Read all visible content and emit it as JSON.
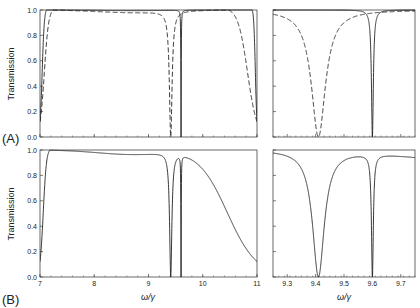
{
  "chart_data": [
    {
      "panel": "A-left",
      "type": "line",
      "xlim": [
        7,
        11
      ],
      "ylim": [
        0,
        1
      ],
      "ylabel": "Transmission",
      "xlabel": "",
      "xticks": [
        7,
        8,
        9,
        10,
        11
      ],
      "xtick_labels_visible": false,
      "yticks": [
        0.0,
        0.2,
        0.4,
        0.6,
        0.8,
        1.0
      ],
      "series": [
        {
          "name": "solid",
          "style": "solid",
          "band_low": 7.0,
          "band_high": 11.0,
          "edge_width_low": 0.08,
          "edge_width_high": 0.06,
          "ripple": 0.005,
          "dips": [
            {
              "center": 9.6,
              "width": 0.004
            }
          ]
        },
        {
          "name": "dashed",
          "style": "dashed",
          "band_low": 7.0,
          "band_high": 11.0,
          "edge_width_low": 0.16,
          "edge_width_high": 0.35,
          "ripple": 0.02,
          "dips": [
            {
              "center": 9.41,
              "width": 0.03
            }
          ]
        }
      ]
    },
    {
      "panel": "A-right",
      "type": "line",
      "xlim": [
        9.25,
        9.75
      ],
      "ylim": [
        0,
        1
      ],
      "xticks": [
        9.3,
        9.4,
        9.5,
        9.6,
        9.7
      ],
      "xtick_labels_visible": false,
      "yticks": [
        0.0,
        0.2,
        0.4,
        0.6,
        0.8,
        1.0
      ],
      "series": [
        {
          "name": "solid",
          "style": "solid",
          "band_low": 7.0,
          "band_high": 11.0,
          "edge_width_low": 0.08,
          "edge_width_high": 0.06,
          "ripple": 0.0,
          "dips": [
            {
              "center": 9.6,
              "width": 0.004
            }
          ]
        },
        {
          "name": "dashed",
          "style": "dashed",
          "band_low": 7.0,
          "band_high": 11.0,
          "edge_width_low": 0.16,
          "edge_width_high": 0.35,
          "ripple": 0.0,
          "dips": [
            {
              "center": 9.41,
              "width": 0.03
            }
          ]
        }
      ]
    },
    {
      "panel": "B-left",
      "type": "line",
      "xlim": [
        7,
        11
      ],
      "ylim": [
        0,
        1
      ],
      "ylabel": "Transmission",
      "xlabel": "ω/γ",
      "xticks": [
        7,
        8,
        9,
        10,
        11
      ],
      "xtick_labels_visible": true,
      "yticks": [
        0.0,
        0.2,
        0.4,
        0.6,
        0.8,
        1.0
      ],
      "series": [
        {
          "name": "solid",
          "style": "solid",
          "band_low": 7.0,
          "band_high": 11.0,
          "edge_width_low": 0.12,
          "edge_width_high": 1.1,
          "ripple": 0.035,
          "dips": [
            {
              "center": 9.41,
              "width": 0.025
            },
            {
              "center": 9.6,
              "width": 0.004
            }
          ]
        }
      ]
    },
    {
      "panel": "B-right",
      "type": "line",
      "xlim": [
        9.25,
        9.75
      ],
      "ylim": [
        0,
        1
      ],
      "xlabel": "ω/γ",
      "xticks": [
        9.3,
        9.4,
        9.5,
        9.6,
        9.7
      ],
      "xtick_labels_visible": true,
      "yticks": [
        0.0,
        0.2,
        0.4,
        0.6,
        0.8,
        1.0
      ],
      "series": [
        {
          "name": "solid",
          "style": "solid",
          "band_low": 7.0,
          "band_high": 11.0,
          "edge_width_low": 0.12,
          "edge_width_high": 1.1,
          "ripple": 0.0,
          "dips": [
            {
              "center": 9.41,
              "width": 0.025
            },
            {
              "center": 9.6,
              "width": 0.004
            }
          ]
        }
      ]
    }
  ],
  "labels": {
    "panel_a": "(A)",
    "panel_b": "(B)",
    "ylabel_top": "Transmission",
    "ylabel_bottom": "Transmission",
    "xlabel_left": "ω/γ",
    "xlabel_right": "ω/γ"
  },
  "style": {
    "line_color": "#222222",
    "axis_color": "#444444",
    "background": "#ffffff"
  }
}
